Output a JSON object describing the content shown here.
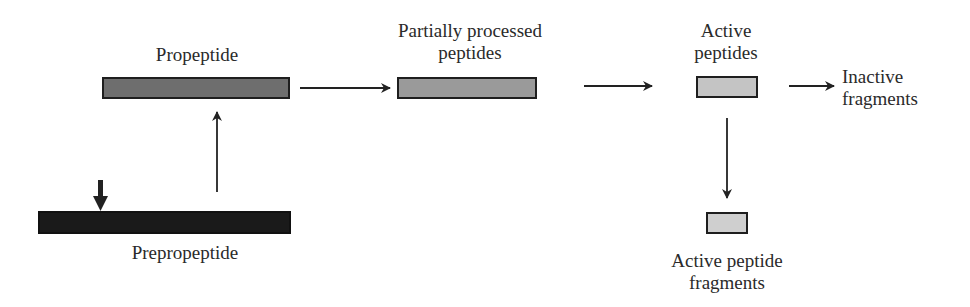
{
  "diagram": {
    "nodes": {
      "prepropeptide": {
        "label": "Prepropeptide",
        "color": "#1a1a1a"
      },
      "propeptide": {
        "label": "Propeptide",
        "color": "#6e6e6e"
      },
      "partially_processed": {
        "label_line1": "Partially processed",
        "label_line2": "peptides",
        "color": "#9a9a9a"
      },
      "active_peptides": {
        "label_line1": "Active",
        "label_line2": "peptides",
        "color": "#c4c4c4"
      },
      "inactive_fragments": {
        "label_line1": "Inactive",
        "label_line2": "fragments"
      },
      "active_fragments": {
        "label_line1": "Active peptide",
        "label_line2": "fragments",
        "color": "#cfcfcf"
      }
    },
    "edges": [
      {
        "from": "prepropeptide",
        "to": "propeptide"
      },
      {
        "from": "propeptide",
        "to": "partially_processed"
      },
      {
        "from": "partially_processed",
        "to": "active_peptides"
      },
      {
        "from": "active_peptides",
        "to": "inactive_fragments"
      },
      {
        "from": "active_peptides",
        "to": "active_fragments"
      }
    ],
    "cleavage_marker": "down-arrow-on-prepropeptide"
  }
}
